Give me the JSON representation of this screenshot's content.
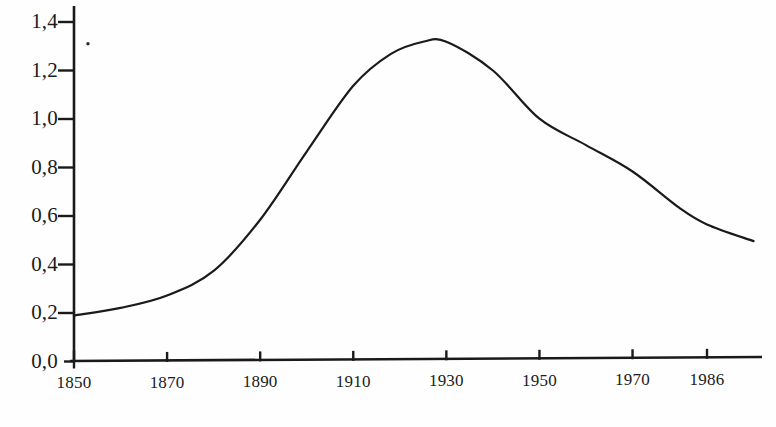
{
  "chart_data": {
    "type": "line",
    "title": "",
    "subtitle": "",
    "xlabel": "",
    "ylabel": "",
    "xlim": [
      1850,
      1996
    ],
    "ylim": [
      0.0,
      1.4
    ],
    "grid": false,
    "legend": null,
    "decimal_separator": ",",
    "x_tick_labels": [
      "1850",
      "1870",
      "1890",
      "1910",
      "1930",
      "1950",
      "1970",
      "1986"
    ],
    "x_tick_values": [
      1850,
      1870,
      1890,
      1910,
      1930,
      1950,
      1970,
      1986
    ],
    "y_tick_labels": [
      "0,0",
      "0,2",
      "0,4",
      "0,6",
      "0,8",
      "1,0",
      "1,2",
      "1,4"
    ],
    "y_tick_values": [
      0.0,
      0.2,
      0.4,
      0.6,
      0.8,
      1.0,
      1.2,
      1.4
    ],
    "series": [
      {
        "name": "curve",
        "color": "#1a1a1a",
        "x": [
          1850,
          1860,
          1870,
          1880,
          1890,
          1900,
          1910,
          1918,
          1925,
          1930,
          1940,
          1950,
          1960,
          1970,
          1980,
          1986,
          1996
        ],
        "values": [
          0.19,
          0.22,
          0.27,
          0.37,
          0.58,
          0.86,
          1.13,
          1.26,
          1.31,
          1.31,
          1.19,
          0.99,
          0.88,
          0.77,
          0.62,
          0.55,
          0.48
        ]
      }
    ],
    "annotations": [
      {
        "name": "stray-dot",
        "x": 1853,
        "y": 1.31
      }
    ]
  },
  "axes": {
    "y_axis_color": "#1a1a1a",
    "x_axis_color": "#1a1a1a",
    "tick_direction_y": "outward-left",
    "tick_direction_x": "outward-up"
  }
}
